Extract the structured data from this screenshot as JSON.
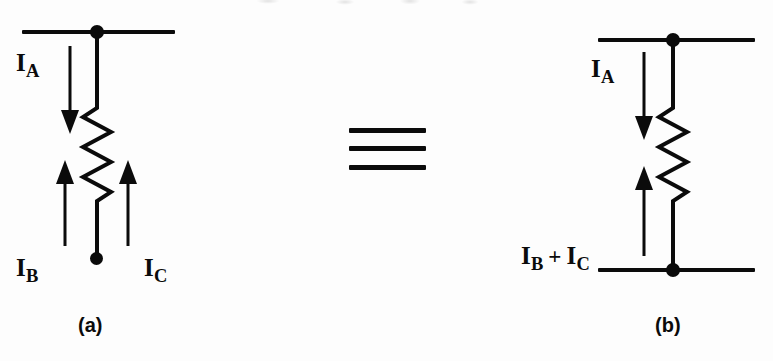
{
  "figure": {
    "type": "circuit-equivalence-diagram",
    "background_color": "#fdfdfd",
    "ink_color": "#0b0b0b"
  },
  "identity_symbol": {
    "glyph": "triple-bar",
    "meaning": "is identical to",
    "bar_count": 3
  },
  "panel_a": {
    "caption": "(a)",
    "labels": {
      "current_a": {
        "symbol": "I",
        "subscript": "A",
        "direction": "down"
      },
      "current_b": {
        "symbol": "I",
        "subscript": "B",
        "direction": "up"
      },
      "current_c": {
        "symbol": "I",
        "subscript": "C",
        "direction": "up"
      }
    },
    "components": {
      "resistor": "zigzag-resistor",
      "top_bus": "horizontal-conductor",
      "top_node": "junction-dot",
      "bottom_terminal": "terminal-dot"
    }
  },
  "panel_b": {
    "caption": "(b)",
    "labels": {
      "current_a": {
        "symbol": "I",
        "subscript": "A",
        "direction": "down"
      },
      "current_sum": {
        "left_symbol": "I",
        "left_subscript": "B",
        "operator": "+",
        "right_symbol": "I",
        "right_subscript": "C",
        "direction": "up"
      }
    },
    "components": {
      "resistor": "zigzag-resistor",
      "top_bus": "horizontal-conductor",
      "bottom_bus": "horizontal-conductor",
      "top_node": "junction-dot",
      "bottom_node": "junction-dot"
    }
  }
}
